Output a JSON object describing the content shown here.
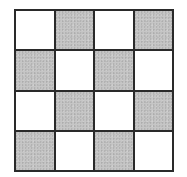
{
  "diagram": {
    "type": "checkerboard-grid",
    "rows": 4,
    "cols": 4,
    "colors": {
      "light": "#ffffff",
      "shaded": "#c6c6c6",
      "border": "#2a2a2a"
    },
    "pattern": [
      [
        "light",
        "shaded",
        "light",
        "shaded"
      ],
      [
        "shaded",
        "light",
        "shaded",
        "light"
      ],
      [
        "light",
        "shaded",
        "light",
        "shaded"
      ],
      [
        "shaded",
        "light",
        "shaded",
        "light"
      ]
    ]
  }
}
